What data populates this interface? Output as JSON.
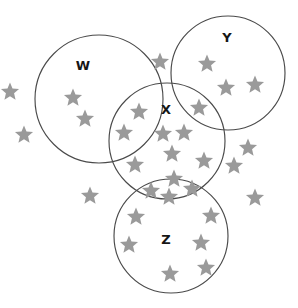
{
  "figure": {
    "title": "",
    "type": "venn-diagram-with-star-items",
    "background_color": "#ffffff",
    "width": 298,
    "height": 308
  },
  "style": {
    "circle_stroke_color": "#4a4a4a",
    "circle_fill": "none",
    "star_color": "#9a9a9a",
    "label_color": "#161616",
    "label_font_size": 13
  },
  "sets": [
    {
      "id": "W",
      "label": "W",
      "cx": 99,
      "cy": 99,
      "r": 64,
      "label_x": 83,
      "label_y": 66
    },
    {
      "id": "Y",
      "label": "Y",
      "cx": 228,
      "cy": 73,
      "r": 57,
      "label_x": 227,
      "label_y": 38
    },
    {
      "id": "X",
      "label": "X",
      "cx": 167,
      "cy": 141,
      "r": 58,
      "label_x": 166,
      "label_y": 110
    },
    {
      "id": "Z",
      "label": "Z",
      "cx": 171,
      "cy": 236,
      "r": 57,
      "label_x": 166,
      "label_y": 240
    }
  ],
  "stars": [
    {
      "x": 10,
      "y": 92,
      "size": 9.5,
      "region": "outside"
    },
    {
      "x": 24,
      "y": 135,
      "size": 9.5,
      "region": "outside"
    },
    {
      "x": 73,
      "y": 98,
      "size": 9.5,
      "region": "W"
    },
    {
      "x": 85,
      "y": 119,
      "size": 9.5,
      "region": "W"
    },
    {
      "x": 160,
      "y": 62,
      "size": 9.5,
      "region": "outside"
    },
    {
      "x": 207,
      "y": 64,
      "size": 9.5,
      "region": "Y"
    },
    {
      "x": 226,
      "y": 88,
      "size": 9.5,
      "region": "Y"
    },
    {
      "x": 255,
      "y": 85,
      "size": 9.5,
      "region": "Y"
    },
    {
      "x": 139,
      "y": 112,
      "size": 9.5,
      "region": "X"
    },
    {
      "x": 199,
      "y": 108,
      "size": 9.5,
      "region": "X_Y"
    },
    {
      "x": 124,
      "y": 133,
      "size": 9.5,
      "region": "W_X"
    },
    {
      "x": 163,
      "y": 134,
      "size": 9.5,
      "region": "X"
    },
    {
      "x": 184,
      "y": 133,
      "size": 9.5,
      "region": "X"
    },
    {
      "x": 172,
      "y": 154,
      "size": 9.5,
      "region": "X"
    },
    {
      "x": 135,
      "y": 165,
      "size": 9.5,
      "region": "X"
    },
    {
      "x": 204,
      "y": 161,
      "size": 9.5,
      "region": "X"
    },
    {
      "x": 248,
      "y": 148,
      "size": 9.5,
      "region": "outside"
    },
    {
      "x": 234,
      "y": 166,
      "size": 9.5,
      "region": "outside"
    },
    {
      "x": 174,
      "y": 179,
      "size": 9.5,
      "region": "X_Z"
    },
    {
      "x": 151,
      "y": 191,
      "size": 9.5,
      "region": "X_Z"
    },
    {
      "x": 192,
      "y": 189,
      "size": 9.5,
      "region": "X_Z"
    },
    {
      "x": 169,
      "y": 197,
      "size": 9.5,
      "region": "X_Z"
    },
    {
      "x": 90,
      "y": 196,
      "size": 9.5,
      "region": "outside"
    },
    {
      "x": 255,
      "y": 198,
      "size": 9.5,
      "region": "outside"
    },
    {
      "x": 136,
      "y": 217,
      "size": 9.5,
      "region": "Z"
    },
    {
      "x": 211,
      "y": 216,
      "size": 9.5,
      "region": "Z"
    },
    {
      "x": 129,
      "y": 245,
      "size": 9.5,
      "region": "Z"
    },
    {
      "x": 201,
      "y": 243,
      "size": 9.5,
      "region": "Z"
    },
    {
      "x": 206,
      "y": 268,
      "size": 9.5,
      "region": "Z"
    },
    {
      "x": 170,
      "y": 274,
      "size": 9.5,
      "region": "Z"
    }
  ]
}
